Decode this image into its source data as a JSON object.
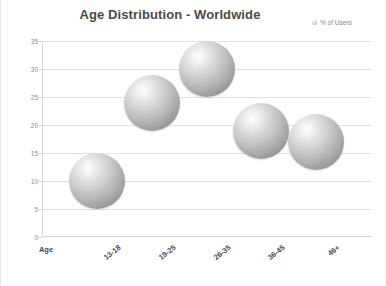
{
  "chart_data": {
    "type": "scatter",
    "title": "Age Distribution - Worldwide",
    "xlabel": "Age",
    "ylabel": "",
    "categories": [
      "13-18",
      "19-25",
      "26-35",
      "36-45",
      "46+"
    ],
    "values": [
      10,
      24,
      30,
      19,
      17
    ],
    "series": [
      {
        "name": "% of Users",
        "values": [
          10,
          24,
          30,
          19,
          17
        ]
      }
    ],
    "ylim": [
      0,
      35
    ],
    "ytick_labels": [
      "0",
      "5",
      "10",
      "15",
      "20",
      "25",
      "30",
      "35"
    ],
    "ytick_values": [
      0,
      5,
      10,
      15,
      20,
      25,
      30,
      35
    ],
    "grid": true,
    "legend_position": "top-right",
    "marker_style": "3d-sphere",
    "marker_color": "#b0b0b0"
  },
  "legend": {
    "label": "% of Users",
    "marker_name": "sphere-marker"
  },
  "axis": {
    "x_corner_label": "Age"
  }
}
